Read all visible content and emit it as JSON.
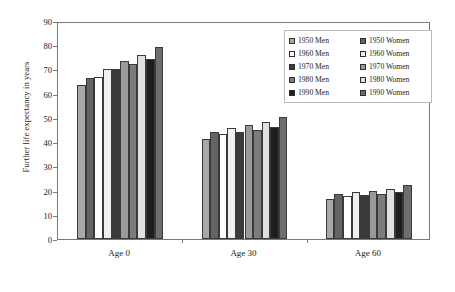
{
  "chart_data": {
    "type": "bar",
    "title": "",
    "xlabel": "",
    "ylabel": "Further life expectancy in years",
    "categories": [
      "Age 0",
      "Age 30",
      "Age 60"
    ],
    "ylim": [
      0,
      90
    ],
    "yticks": [
      0,
      10,
      20,
      30,
      40,
      50,
      60,
      70,
      80,
      90
    ],
    "grid": false,
    "legend_position": "top-right",
    "series": [
      {
        "name": "1950 Men",
        "color": "#a8a8a8",
        "values": [
          63.5,
          41.2,
          16.5
        ]
      },
      {
        "name": "1950 Women",
        "color": "#646464",
        "values": [
          66.5,
          44.0,
          18.5
        ]
      },
      {
        "name": "1960 Men",
        "color": "#ffffff",
        "values": [
          67.0,
          43.5,
          17.8
        ]
      },
      {
        "name": "1960 Women",
        "color": "#f0f0f0",
        "values": [
          70.3,
          46.0,
          19.3
        ]
      },
      {
        "name": "1970 Men",
        "color": "#3a3a3a",
        "values": [
          70.0,
          44.3,
          18.0
        ]
      },
      {
        "name": "1970 Women",
        "color": "#9a9a9a",
        "values": [
          73.3,
          47.0,
          19.8
        ]
      },
      {
        "name": "1980 Men",
        "color": "#7c7c7c",
        "values": [
          72.2,
          45.0,
          18.4
        ]
      },
      {
        "name": "1980 Women",
        "color": "#e0e0e0",
        "values": [
          76.0,
          48.3,
          20.8
        ]
      },
      {
        "name": "1990 Men",
        "color": "#1e1e1e",
        "values": [
          74.5,
          46.2,
          19.5
        ]
      },
      {
        "name": "1990 Women",
        "color": "#6e6e6e",
        "values": [
          79.3,
          50.5,
          22.3
        ]
      }
    ]
  },
  "legend": {
    "entries": [
      {
        "label": "1950 Men",
        "color": "#a8a8a8"
      },
      {
        "label": "1950 Women",
        "color": "#646464"
      },
      {
        "label": "1960 Men",
        "color": "#ffffff"
      },
      {
        "label": "1960 Women",
        "color": "#f0f0f0"
      },
      {
        "label": "1970 Men",
        "color": "#3a3a3a"
      },
      {
        "label": "1970 Women",
        "color": "#9a9a9a"
      },
      {
        "label": "1980 Men",
        "color": "#7c7c7c"
      },
      {
        "label": "1980 Women",
        "color": "#e0e0e0"
      },
      {
        "label": "1990 Men",
        "color": "#1e1e1e"
      },
      {
        "label": "1990 Women",
        "color": "#6e6e6e"
      }
    ]
  },
  "colors": {
    "frame": "#7a7a7a",
    "bar_outline": "#3a3a3a",
    "text": "#1a1a1a",
    "background": "#ffffff"
  }
}
